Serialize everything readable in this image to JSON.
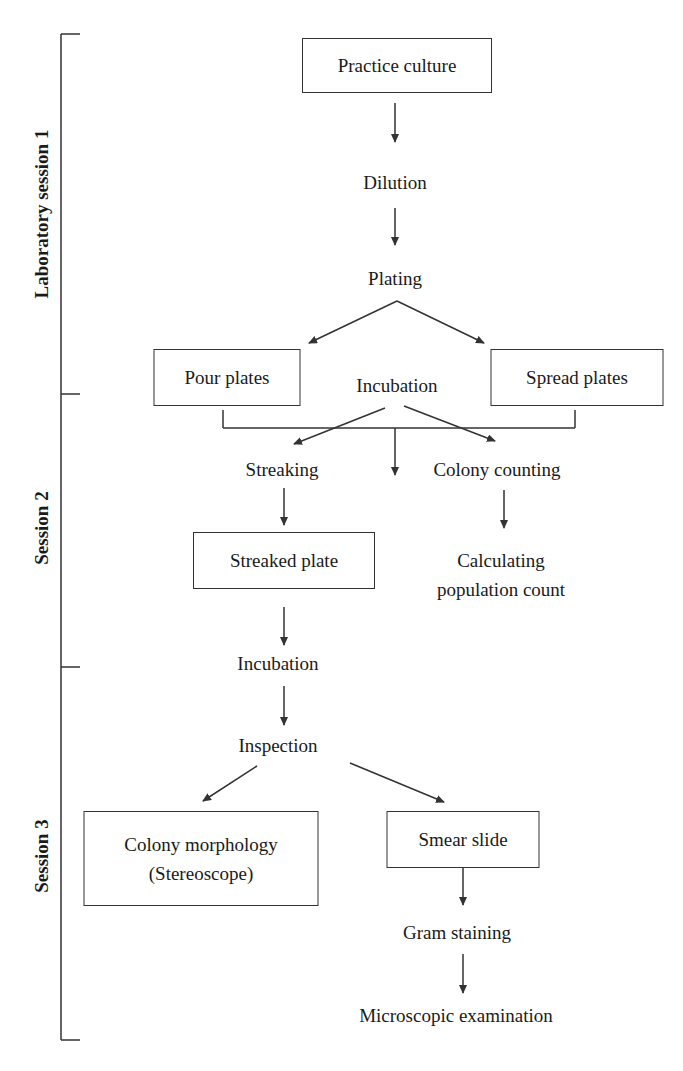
{
  "sessions": [
    {
      "label": "Laboratory session 1"
    },
    {
      "label": "Session 2"
    },
    {
      "label": "Session 3"
    }
  ],
  "nodes": {
    "practice_culture": "Practice culture",
    "dilution": "Dilution",
    "plating": "Plating",
    "pour_plates": "Pour plates",
    "spread_plates": "Spread plates",
    "incubation_1": "Incubation",
    "streaking": "Streaking",
    "colony_counting": "Colony counting",
    "calculating_line1": "Calculating",
    "calculating_line2": "population count",
    "streaked_plate": "Streaked plate",
    "incubation_2": "Incubation",
    "inspection": "Inspection",
    "colony_morphology_line1": "Colony morphology",
    "colony_morphology_line2": "(Stereoscope)",
    "smear_slide": "Smear slide",
    "gram_staining": "Gram staining",
    "microscopic_examination": "Microscopic examination"
  },
  "colors": {
    "line": "#333333",
    "text": "#1a1a1a",
    "background": "#ffffff"
  }
}
